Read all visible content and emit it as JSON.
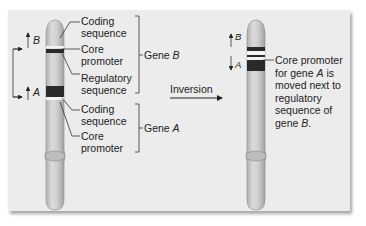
{
  "figure": {
    "left_chromosome": {
      "gene_b_parts": [
        {
          "label": "Coding\nsequence"
        },
        {
          "label": "Core\npromoter"
        },
        {
          "label": "Regulatory\nsequence"
        }
      ],
      "gene_b_bracket_label": "Gene ",
      "gene_b_letter": "B",
      "gene_a_parts": [
        {
          "label": "Coding\nsequence"
        },
        {
          "label": "Core\npromoter"
        }
      ],
      "gene_a_bracket_label": "Gene ",
      "gene_a_letter": "A",
      "arrow_b": "B",
      "arrow_a": "A"
    },
    "transition": {
      "label": "Inversion"
    },
    "right_chromosome": {
      "arrow_b": "B",
      "arrow_a": "A",
      "note_lines": [
        "Core promoter",
        "for gene ",
        "A",
        " is",
        "moved next to",
        "regulatory",
        "sequence of",
        "gene ",
        "B",
        "."
      ]
    },
    "colors": {
      "panel": "#ececec",
      "chromosome": "#c9c9c9",
      "dark_band": "#2a2a2a",
      "light_band": "#f4f4f4"
    }
  }
}
